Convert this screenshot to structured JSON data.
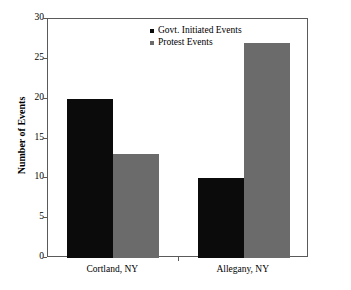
{
  "chart_data": {
    "type": "bar",
    "title": "",
    "xlabel": "",
    "ylabel": "Number of Events",
    "categories": [
      "Cortland, NY",
      "Allegany, NY"
    ],
    "series": [
      {
        "name": "Govt. Initiated Events",
        "color": "#0b0b0b",
        "values": [
          20,
          10
        ]
      },
      {
        "name": "Protest Events",
        "color": "#6b6b6b",
        "values": [
          13,
          27
        ]
      }
    ],
    "ylim": [
      0,
      30
    ],
    "yticks": [
      0,
      5,
      10,
      15,
      20,
      25,
      30
    ],
    "ytick_labels": [
      "0",
      "5",
      "10",
      "15",
      "20",
      "25",
      "30"
    ],
    "grid": false,
    "legend_position": "top-center",
    "frame": true
  },
  "legend": {
    "items": [
      {
        "label": "Govt. Initiated Events",
        "swatch": "legend-swatch-dark"
      },
      {
        "label": "Protest Events",
        "swatch": "legend-swatch-gray"
      }
    ]
  },
  "axes": {
    "y_title": "Number of Events"
  }
}
